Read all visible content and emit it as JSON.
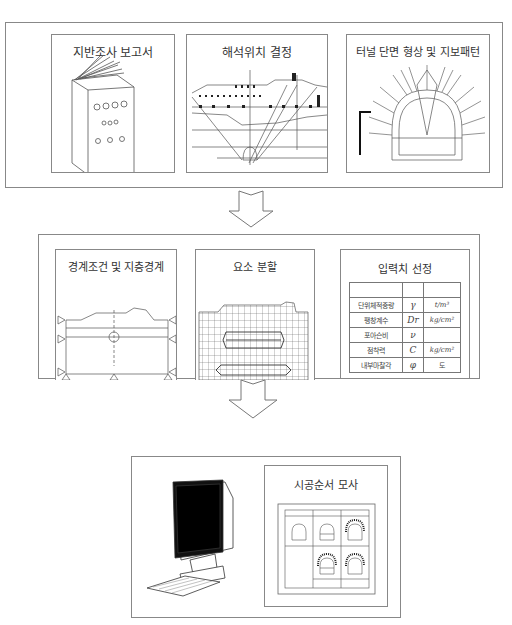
{
  "stages": [
    {
      "id": "stage-1",
      "panels": [
        {
          "title": "지반조사 보고서",
          "icon": "book-icon"
        },
        {
          "title": "해석위치 결정",
          "icon": "site-section-icon"
        },
        {
          "title": "터널 단면 형상 및 지보패턴",
          "icon": "tunnel-section-icon"
        }
      ]
    },
    {
      "id": "stage-2",
      "panels": [
        {
          "title": "경계조건 및 지층경계",
          "icon": "boundary-condition-icon"
        },
        {
          "title": "요소 분할",
          "icon": "mesh-icon"
        },
        {
          "title": "입력치 선정",
          "table": {
            "rows": [
              {
                "name": "",
                "symbol": "",
                "unit": ""
              },
              {
                "name": "단위체적중량",
                "symbol": "γ",
                "unit": "t/m³"
              },
              {
                "name": "팽창계수",
                "symbol": "Dr",
                "unit": "kg/cm²"
              },
              {
                "name": "포아슨비",
                "symbol": "ν",
                "unit": ""
              },
              {
                "name": "점착력",
                "symbol": "C",
                "unit": "kg/cm²"
              },
              {
                "name": "내부마찰각",
                "symbol": "φ",
                "unit": "도"
              }
            ]
          }
        }
      ]
    },
    {
      "id": "stage-3",
      "panels": [
        {
          "title": "",
          "icon": "computer-icon"
        },
        {
          "title": "시공순서 모사",
          "icon": "construction-sequence-icon"
        }
      ]
    }
  ],
  "arrows": [
    {
      "from": "stage-1",
      "to": "stage-2",
      "icon": "down-arrow-icon"
    },
    {
      "from": "stage-2",
      "to": "stage-3",
      "icon": "down-arrow-icon"
    }
  ],
  "colors": {
    "line": "#888888",
    "text": "#333333"
  }
}
